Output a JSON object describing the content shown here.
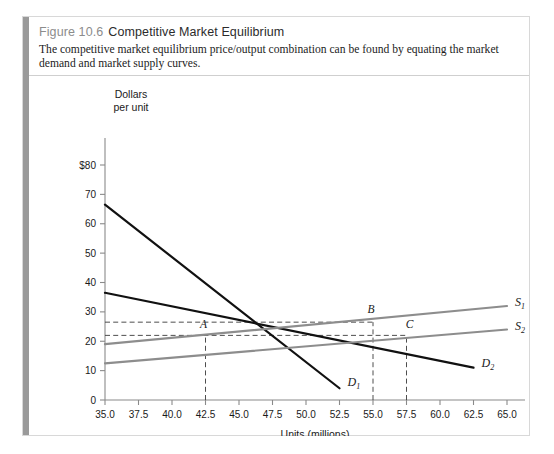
{
  "figure": {
    "number": "Figure 10.6",
    "title": "Competitive Market Equilibrium",
    "caption": "The competitive market equilibrium price/output combination can be found by equating the market demand and market supply curves."
  },
  "chart_data": {
    "type": "line",
    "title": "",
    "xlabel": "Units (millions)",
    "ylabel_line1": "Dollars",
    "ylabel_line2": "per unit",
    "xlim": [
      35.0,
      65.0
    ],
    "ylim": [
      0,
      80
    ],
    "xticks": [
      "35.0",
      "37.5",
      "40.0",
      "42.5",
      "45.0",
      "47.5",
      "50.0",
      "52.5",
      "55.0",
      "57.5",
      "60.0",
      "62.5",
      "65.0"
    ],
    "xtick_values": [
      35.0,
      37.5,
      40.0,
      42.5,
      45.0,
      47.5,
      50.0,
      52.5,
      55.0,
      57.5,
      60.0,
      62.5,
      65.0
    ],
    "yticks": [
      "0",
      "10",
      "20",
      "30",
      "40",
      "50",
      "60",
      "70",
      "$80"
    ],
    "ytick_values": [
      0,
      10,
      20,
      30,
      40,
      50,
      60,
      70,
      80
    ],
    "grid": false,
    "legend": "inline-curve-labels",
    "series": [
      {
        "name": "D1",
        "label": "D",
        "subscript": "1",
        "kind": "demand",
        "color": "#111111",
        "points": [
          [
            35.0,
            66.5
          ],
          [
            52.5,
            4.0
          ]
        ]
      },
      {
        "name": "D2",
        "label": "D",
        "subscript": "2",
        "kind": "demand",
        "color": "#111111",
        "points": [
          [
            35.0,
            36.5
          ],
          [
            62.5,
            11.0
          ]
        ]
      },
      {
        "name": "S1",
        "label": "S",
        "subscript": "1",
        "kind": "supply",
        "color": "#8d8d8d",
        "points": [
          [
            35.0,
            19.0
          ],
          [
            65.0,
            32.0
          ]
        ]
      },
      {
        "name": "S2",
        "label": "S",
        "subscript": "2",
        "kind": "supply",
        "color": "#8d8d8d",
        "points": [
          [
            35.0,
            12.5
          ],
          [
            65.0,
            24.0
          ]
        ]
      }
    ],
    "annotations": [
      {
        "label": "A",
        "x": 42.5,
        "y": 22.0,
        "note": "D1 meets S1"
      },
      {
        "label": "B",
        "x": 55.0,
        "y": 26.5,
        "note": "D2 meets S1"
      },
      {
        "label": "C",
        "x": 57.5,
        "y": 22.0,
        "note": "D2 meets S2"
      }
    ],
    "guide_lines": {
      "horizontal_values": [
        26.5,
        22.0
      ],
      "vertical_values": [
        42.5,
        55.0,
        57.5
      ]
    }
  }
}
